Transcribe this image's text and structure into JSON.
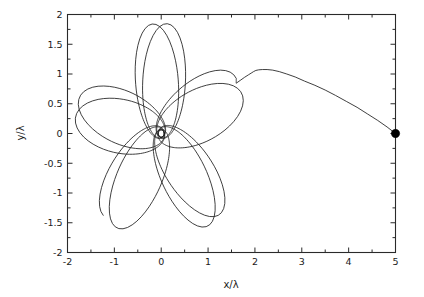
{
  "chart_data": {
    "type": "line",
    "title": "",
    "subtitle": "",
    "xlabel": "x/λ",
    "ylabel": "y/λ",
    "xlim": [
      -2,
      5
    ],
    "ylim": [
      -2,
      2
    ],
    "grid": false,
    "legend": null,
    "legend_position": "none",
    "xticks": [
      -2,
      -1,
      0,
      1,
      2,
      3,
      4,
      5
    ],
    "xtick_labels": [
      "-2",
      "-1",
      "0",
      "1",
      "2",
      "3",
      "4",
      "5"
    ],
    "yticks": [
      -2,
      -1.5,
      -1,
      -0.5,
      0,
      0.5,
      1,
      1.5,
      2
    ],
    "ytick_labels": [
      "-2",
      "-1.5",
      "-1",
      "-0.5",
      "0",
      "0.5",
      "1",
      "1.5",
      "2"
    ],
    "minor_xticks": [
      -1.5,
      -0.5,
      0.5,
      1.5,
      2.5,
      3.5,
      4.5
    ],
    "minor_yticks": [
      -1.75,
      -1.25,
      -0.75,
      -0.25,
      0.25,
      0.75,
      1.25,
      1.75
    ],
    "line_color": "#1d1d1d",
    "line_width": 0.85,
    "marker_color": "#000000",
    "annotations": [
      {
        "name": "start-marker",
        "type": "filled-circle",
        "x": 5.0,
        "y": 0.0,
        "radius_px": 4.2,
        "label": ""
      }
    ],
    "series": [
      {
        "name": "infall-approach",
        "description": "Incoming trajectory from the marker at (5,0) rising to apex near (2, 1.07) then turning inward",
        "x": [
          5.0,
          4.82,
          4.62,
          4.4,
          4.18,
          3.95,
          3.72,
          3.5,
          3.28,
          3.06,
          2.86,
          2.68,
          2.52,
          2.38,
          2.26,
          2.16,
          2.08,
          2.02,
          1.97,
          1.92,
          1.86,
          1.78,
          1.7,
          1.6
        ],
        "y": [
          0.0,
          0.11,
          0.22,
          0.33,
          0.44,
          0.54,
          0.64,
          0.73,
          0.81,
          0.88,
          0.95,
          1.0,
          1.04,
          1.065,
          1.075,
          1.075,
          1.07,
          1.06,
          1.04,
          1.015,
          0.985,
          0.945,
          0.9,
          0.845
        ]
      },
      {
        "name": "rosette-orbit",
        "description": "Precessing multi-petal rosette orbit about the origin, apoapsis approximately 1.85 lambda, periapsis near 0, roughly 9 petals with prograde precession",
        "petal_count": 9,
        "r_apo": 1.85,
        "r_peri": 0.06,
        "precession_deg_per_orbit": 142,
        "start_angle_deg": 30,
        "samples_per_petal": 200
      }
    ]
  },
  "figure": {
    "background_color": "#ffffff",
    "frame_color": "#2a2a2a",
    "width_px": 424,
    "height_px": 297
  }
}
